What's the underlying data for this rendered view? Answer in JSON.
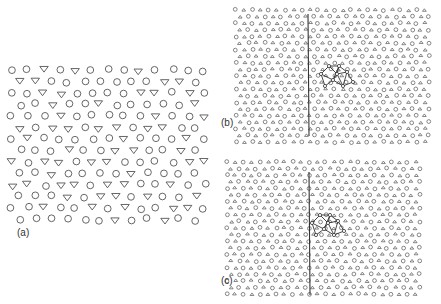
{
  "figure": {
    "panels": [
      {
        "id": "a",
        "label": "(a)",
        "label_pos": [
          17,
          233
        ],
        "description": "Quasi-periodic arrangement of circles and downward triangles",
        "region": {
          "x0": 12,
          "y0": 70,
          "x1": 208,
          "y1": 225
        },
        "symbol_size": 4.2,
        "rows": 14,
        "cols": 13,
        "symbols": [
          "circle",
          "triangle-down"
        ]
      },
      {
        "id": "b",
        "label": "(b)",
        "label_pos": [
          221,
          123
        ],
        "description": "Dense lattice with vertical grain boundary line and highlighted triangular cluster",
        "region": {
          "x0": 236,
          "y0": 8,
          "x1": 432,
          "y1": 143
        },
        "symbol_size": 2.1,
        "boundary_line": {
          "x": 308,
          "y0": 14,
          "y1": 136
        },
        "cluster": {
          "cx": 335,
          "cy": 78
        }
      },
      {
        "id": "c",
        "label": "(c)",
        "label_pos": [
          221,
          281
        ],
        "description": "Dense lattice with vertical grain boundary line and highlighted triangular cluster",
        "region": {
          "x0": 227,
          "y0": 160,
          "x1": 421,
          "y1": 296
        },
        "symbol_size": 2.1,
        "boundary_line": {
          "x": 309,
          "y0": 172,
          "y1": 295
        },
        "cluster": {
          "cx": 326,
          "cy": 227
        }
      }
    ],
    "stroke_color": "#555555",
    "line_color": "#333333"
  }
}
